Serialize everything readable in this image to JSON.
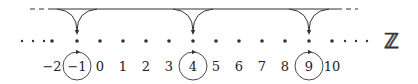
{
  "diagram": {
    "title_symbol": "ℤ",
    "colors": {
      "stroke": "#333333",
      "text": "#222222",
      "background": "#ffffff"
    },
    "top_line": {
      "y": 9,
      "dash_left": [
        30,
        52
      ],
      "solid": [
        52,
        337
      ],
      "dash_right": [
        337,
        358
      ]
    },
    "dot_row_y": 41,
    "label_row_y": 66,
    "ellipsis_left_x": [
      22,
      33,
      44
    ],
    "ellipsis_right_x": [
      345,
      356,
      367
    ],
    "integers": [
      {
        "value": -2,
        "label": "−2",
        "x": 52
      },
      {
        "value": -1,
        "label": "−1",
        "x": 77,
        "circled": true
      },
      {
        "value": 0,
        "label": "0",
        "x": 100
      },
      {
        "value": 1,
        "label": "1",
        "x": 123
      },
      {
        "value": 2,
        "label": "2",
        "x": 146
      },
      {
        "value": 3,
        "label": "3",
        "x": 169
      },
      {
        "value": 4,
        "label": "4",
        "x": 193,
        "circled": true
      },
      {
        "value": 5,
        "label": "5",
        "x": 216
      },
      {
        "value": 6,
        "label": "6",
        "x": 239
      },
      {
        "value": 7,
        "label": "7",
        "x": 262
      },
      {
        "value": 8,
        "label": "8",
        "x": 285
      },
      {
        "value": 9,
        "label": "9",
        "x": 309,
        "circled": true
      },
      {
        "value": 10,
        "label": "10",
        "x": 332
      }
    ],
    "funnels": [
      {
        "target": -1,
        "x": 77
      },
      {
        "target": 4,
        "x": 193
      },
      {
        "target": 9,
        "x": 309
      }
    ],
    "circle_radius": 14
  }
}
